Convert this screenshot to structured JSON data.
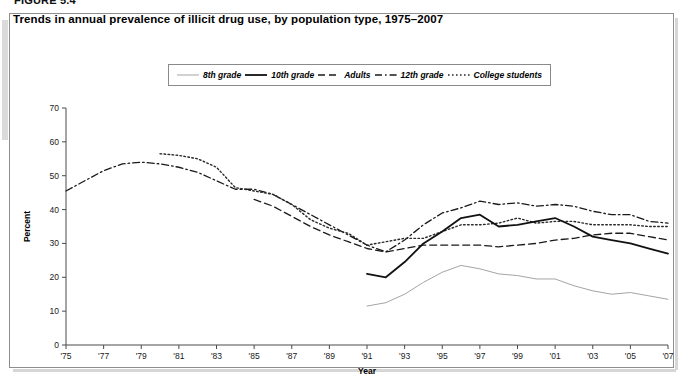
{
  "figure": {
    "number": "FIGURE 5.4"
  },
  "title": "Trends in annual prevalence of illicit drug use, by population type, 1975–2007",
  "legend": {
    "items": [
      {
        "label": "8th grade",
        "style": "thin-solid",
        "color": "#9a9a9a"
      },
      {
        "label": "10th grade",
        "style": "thick-solid",
        "color": "#111111"
      },
      {
        "label": "Adults",
        "style": "dashed",
        "color": "#1a1a1a"
      },
      {
        "label": "12th grade",
        "style": "dash-dot",
        "color": "#1a1a1a"
      },
      {
        "label": "College students",
        "style": "dotted",
        "color": "#2a2a2a"
      }
    ]
  },
  "chart_data": {
    "type": "line",
    "title": "Trends in annual prevalence of illicit drug use, by population type, 1975–2007",
    "xlabel": "Year",
    "ylabel": "Percent",
    "xlim": [
      1975,
      2007
    ],
    "ylim": [
      0,
      70
    ],
    "yticks": [
      0,
      10,
      20,
      30,
      40,
      50,
      60,
      70
    ],
    "xticks": [
      1975,
      1977,
      1979,
      1981,
      1983,
      1985,
      1987,
      1989,
      1991,
      1993,
      1995,
      1997,
      1999,
      2001,
      2003,
      2005,
      2007
    ],
    "xtick_labels": [
      "'75",
      "'77",
      "'79",
      "'81",
      "'83",
      "'85",
      "'87",
      "'89",
      "'91",
      "'93",
      "'95",
      "'97",
      "'99",
      "'01",
      "'03",
      "'05",
      "'07"
    ],
    "grid": false,
    "legend_position": "top-center",
    "series": [
      {
        "name": "12th grade",
        "style": "dash-dot",
        "color": "#1a1a1a",
        "x": [
          1975,
          1976,
          1977,
          1978,
          1979,
          1980,
          1981,
          1982,
          1983,
          1984,
          1985,
          1986,
          1987,
          1988,
          1989,
          1990,
          1991,
          1992,
          1993,
          1994,
          1995,
          1996,
          1997,
          1998,
          1999,
          2000,
          2001,
          2002,
          2003,
          2004,
          2005,
          2006,
          2007
        ],
        "y": [
          45.5,
          48.5,
          51.5,
          53.5,
          54.0,
          53.5,
          52.5,
          51.0,
          48.5,
          46.0,
          46.0,
          44.5,
          41.5,
          38.5,
          35.5,
          32.5,
          29.5,
          27.5,
          31.0,
          35.5,
          39.0,
          40.5,
          42.5,
          41.5,
          42.0,
          41.0,
          41.5,
          41.0,
          39.5,
          38.5,
          38.5,
          36.5,
          36.0
        ]
      },
      {
        "name": "College students",
        "style": "dotted",
        "color": "#2a2a2a",
        "x": [
          1980,
          1981,
          1982,
          1983,
          1984,
          1985,
          1986,
          1987,
          1988,
          1989,
          1990,
          1991,
          1992,
          1993,
          1994,
          1995,
          1996,
          1997,
          1998,
          1999,
          2000,
          2001,
          2002,
          2003,
          2004,
          2005,
          2006,
          2007
        ],
        "y": [
          56.5,
          56.0,
          55.0,
          52.5,
          46.5,
          45.5,
          44.5,
          41.5,
          37.0,
          34.5,
          33.0,
          29.5,
          30.5,
          31.5,
          31.5,
          33.5,
          35.5,
          35.5,
          36.0,
          37.5,
          36.0,
          36.5,
          36.5,
          35.5,
          35.5,
          35.5,
          35.0,
          35.0
        ]
      },
      {
        "name": "Adults",
        "style": "dashed",
        "color": "#1a1a1a",
        "x": [
          1985,
          1986,
          1987,
          1988,
          1989,
          1990,
          1991,
          1992,
          1993,
          1994,
          1995,
          1996,
          1997,
          1998,
          1999,
          2000,
          2001,
          2002,
          2003,
          2004,
          2005,
          2006,
          2007
        ],
        "y": [
          43.0,
          41.0,
          38.0,
          35.0,
          32.5,
          30.5,
          28.5,
          27.5,
          28.5,
          29.5,
          29.5,
          29.5,
          29.5,
          29.0,
          29.5,
          30.0,
          31.0,
          31.5,
          32.5,
          33.0,
          33.0,
          32.0,
          31.0
        ]
      },
      {
        "name": "10th grade",
        "style": "thick-solid",
        "color": "#111111",
        "x": [
          1991,
          1992,
          1993,
          1994,
          1995,
          1996,
          1997,
          1998,
          1999,
          2000,
          2001,
          2002,
          2003,
          2004,
          2005,
          2006,
          2007
        ],
        "y": [
          21.0,
          20.0,
          24.5,
          30.0,
          33.5,
          37.5,
          38.5,
          35.0,
          35.5,
          36.5,
          37.5,
          35.0,
          32.0,
          31.0,
          30.0,
          28.5,
          27.0
        ]
      },
      {
        "name": "8th grade",
        "style": "thin-solid",
        "color": "#9a9a9a",
        "x": [
          1991,
          1992,
          1993,
          1994,
          1995,
          1996,
          1997,
          1998,
          1999,
          2000,
          2001,
          2002,
          2003,
          2004,
          2005,
          2006,
          2007
        ],
        "y": [
          11.5,
          12.5,
          15.0,
          18.5,
          21.5,
          23.5,
          22.5,
          21.0,
          20.5,
          19.5,
          19.5,
          17.5,
          16.0,
          15.0,
          15.5,
          14.5,
          13.5
        ]
      }
    ]
  }
}
